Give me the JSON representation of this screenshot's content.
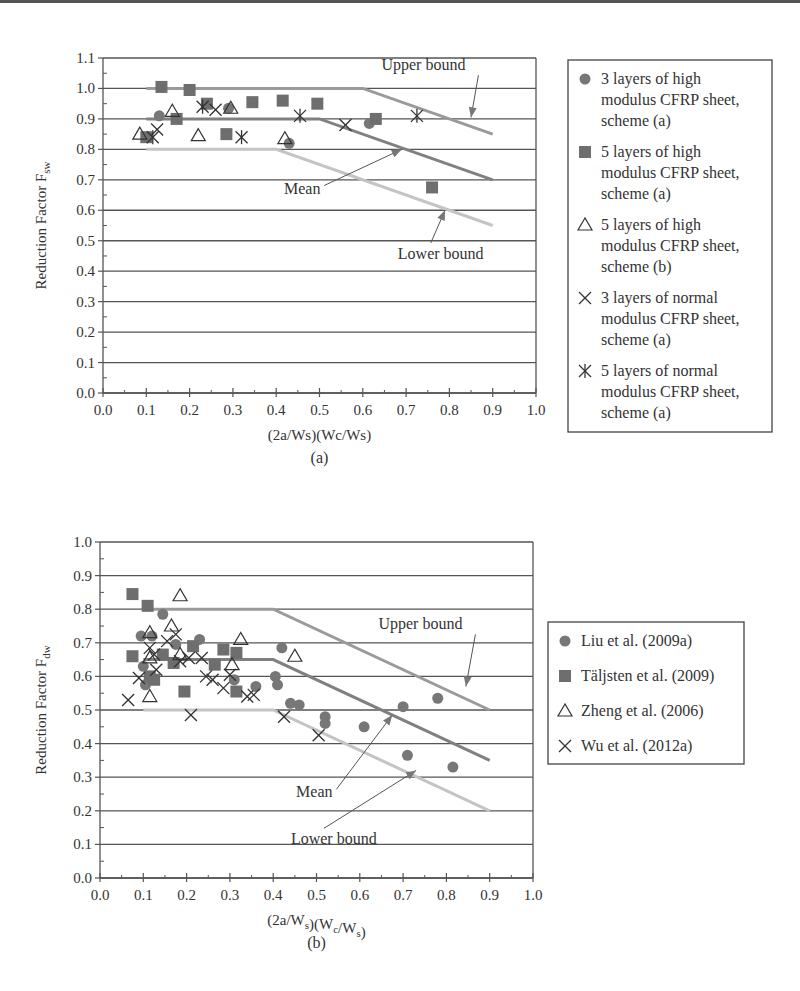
{
  "colors": {
    "grid": "#555555",
    "marker_fill": "#777777",
    "upper_line": "#9a9a9a",
    "mean_line": "#808080",
    "lower_line": "#c4c4c4",
    "text": "#333333"
  },
  "chart_data": [
    {
      "id": "a",
      "type": "scatter",
      "panel_label": "(a)",
      "title": "",
      "xlabel": "(2a/Ws)(Wc/Ws)",
      "ylabel": "Reduction Factor F",
      "ylabel_sub": "sw",
      "xlim": [
        0.0,
        1.0
      ],
      "ylim": [
        0.0,
        1.1
      ],
      "xticks": [
        "0.0",
        "0.1",
        "0.2",
        "0.3",
        "0.4",
        "0.5",
        "0.6",
        "0.7",
        "0.8",
        "0.9",
        "1.0"
      ],
      "yticks": [
        "0.0",
        "0.1",
        "0.2",
        "0.3",
        "0.4",
        "0.5",
        "0.6",
        "0.7",
        "0.8",
        "0.9",
        "1.0",
        "1.1"
      ],
      "grid": true,
      "legend_position": "right",
      "lines": [
        {
          "name": "Upper bound",
          "points": [
            [
              0.1,
              1.0
            ],
            [
              0.6,
              1.0
            ],
            [
              0.9,
              0.85
            ]
          ]
        },
        {
          "name": "Mean",
          "points": [
            [
              0.1,
              0.9
            ],
            [
              0.5,
              0.9
            ],
            [
              0.9,
              0.7
            ]
          ]
        },
        {
          "name": "Lower bound",
          "points": [
            [
              0.1,
              0.8
            ],
            [
              0.4,
              0.8
            ],
            [
              0.9,
              0.55
            ]
          ]
        }
      ],
      "annotations": [
        {
          "text": "Upper bound",
          "label_at": [
            0.74,
            1.06
          ],
          "arrow_to": [
            0.85,
            0.905
          ]
        },
        {
          "text": "Mean",
          "label_at": [
            0.46,
            0.655
          ],
          "arrow_to": [
            0.69,
            0.8
          ]
        },
        {
          "text": "Lower bound",
          "label_at": [
            0.78,
            0.44
          ],
          "arrow_to": [
            0.79,
            0.6
          ]
        }
      ],
      "series": [
        {
          "name": "3 layers of high modulus CFRP sheet, scheme (a)",
          "legend_lines": [
            "3 layers of high",
            "modulus CFRP sheet,",
            "scheme (a)"
          ],
          "marker": "circle",
          "points": [
            [
              0.13,
              0.91
            ],
            [
              0.29,
              0.935
            ],
            [
              0.43,
              0.82
            ],
            [
              0.615,
              0.885
            ]
          ]
        },
        {
          "name": "5 layers of high modulus CFRP sheet, scheme (a)",
          "legend_lines": [
            "5 layers of high",
            "modulus CFRP sheet,",
            "scheme (a)"
          ],
          "marker": "square",
          "points": [
            [
              0.1,
              0.84
            ],
            [
              0.135,
              1.005
            ],
            [
              0.17,
              0.9
            ],
            [
              0.2,
              0.995
            ],
            [
              0.24,
              0.95
            ],
            [
              0.285,
              0.85
            ],
            [
              0.345,
              0.955
            ],
            [
              0.415,
              0.96
            ],
            [
              0.495,
              0.95
            ],
            [
              0.63,
              0.9
            ],
            [
              0.76,
              0.675
            ]
          ]
        },
        {
          "name": "5 layers of high modulus CFRP sheet, scheme (b)",
          "legend_lines": [
            "5 layers of high",
            "modulus CFRP sheet,",
            "scheme (b)"
          ],
          "marker": "triangle",
          "points": [
            [
              0.085,
              0.85
            ],
            [
              0.16,
              0.925
            ],
            [
              0.22,
              0.845
            ],
            [
              0.295,
              0.935
            ],
            [
              0.42,
              0.835
            ]
          ]
        },
        {
          "name": "3 layers of normal modulus CFRP sheet, scheme (a)",
          "legend_lines": [
            "3 layers of normal",
            "modulus CFRP sheet,",
            "scheme (a)"
          ],
          "marker": "x",
          "points": [
            [
              0.125,
              0.865
            ],
            [
              0.26,
              0.93
            ],
            [
              0.56,
              0.88
            ]
          ]
        },
        {
          "name": "5 layers of normal modulus CFRP sheet, scheme (a)",
          "legend_lines": [
            "5 layers of normal",
            "modulus CFRP sheet,",
            "scheme (a)"
          ],
          "marker": "asterisk",
          "points": [
            [
              0.115,
              0.84
            ],
            [
              0.23,
              0.94
            ],
            [
              0.32,
              0.84
            ],
            [
              0.455,
              0.91
            ],
            [
              0.725,
              0.91
            ]
          ]
        }
      ]
    },
    {
      "id": "b",
      "type": "scatter",
      "panel_label": "(b)",
      "title": "",
      "xlabel": "(2a/W",
      "xlabel_parts": [
        [
          "(2a/W",
          ""
        ],
        [
          "s",
          "sub"
        ],
        [
          ")(W",
          ""
        ],
        [
          "c",
          "sub"
        ],
        [
          "/W",
          ""
        ],
        [
          "s",
          "sub"
        ],
        [
          ")",
          ""
        ]
      ],
      "ylabel": "Reduction Factor F",
      "ylabel_sub": "dw",
      "xlim": [
        0.0,
        1.0
      ],
      "ylim": [
        0.0,
        1.0
      ],
      "xticks": [
        "0.0",
        "0.1",
        "0.2",
        "0.3",
        "0.4",
        "0.5",
        "0.6",
        "0.7",
        "0.8",
        "0.9",
        "1.0"
      ],
      "yticks": [
        "0.0",
        "0.1",
        "0.2",
        "0.3",
        "0.4",
        "0.5",
        "0.6",
        "0.7",
        "0.8",
        "0.9",
        "1.0"
      ],
      "grid": true,
      "legend_position": "right",
      "lines": [
        {
          "name": "Upper bound",
          "points": [
            [
              0.1,
              0.8
            ],
            [
              0.4,
              0.8
            ],
            [
              0.9,
              0.5
            ]
          ]
        },
        {
          "name": "Mean",
          "points": [
            [
              0.1,
              0.65
            ],
            [
              0.4,
              0.65
            ],
            [
              0.9,
              0.35
            ]
          ]
        },
        {
          "name": "Lower bound",
          "points": [
            [
              0.1,
              0.5
            ],
            [
              0.4,
              0.5
            ],
            [
              0.9,
              0.2
            ]
          ]
        }
      ],
      "annotations": [
        {
          "text": "Upper bound",
          "label_at": [
            0.74,
            0.74
          ],
          "arrow_to": [
            0.845,
            0.57
          ]
        },
        {
          "text": "Mean",
          "label_at": [
            0.495,
            0.24
          ],
          "arrow_to": [
            0.675,
            0.485
          ]
        },
        {
          "text": "Lower bound",
          "label_at": [
            0.54,
            0.1
          ],
          "arrow_to": [
            0.73,
            0.32
          ]
        }
      ],
      "series": [
        {
          "name": "Liu et al. (2009a)",
          "marker": "circle",
          "points": [
            [
              0.095,
              0.72
            ],
            [
              0.1,
              0.63
            ],
            [
              0.105,
              0.575
            ],
            [
              0.12,
              0.72
            ],
            [
              0.145,
              0.785
            ],
            [
              0.175,
              0.695
            ],
            [
              0.17,
              0.64
            ],
            [
              0.23,
              0.71
            ],
            [
              0.31,
              0.59
            ],
            [
              0.36,
              0.57
            ],
            [
              0.42,
              0.685
            ],
            [
              0.405,
              0.6
            ],
            [
              0.41,
              0.575
            ],
            [
              0.44,
              0.52
            ],
            [
              0.46,
              0.515
            ],
            [
              0.52,
              0.48
            ],
            [
              0.52,
              0.46
            ],
            [
              0.61,
              0.45
            ],
            [
              0.7,
              0.51
            ],
            [
              0.71,
              0.365
            ],
            [
              0.78,
              0.535
            ],
            [
              0.815,
              0.33
            ]
          ]
        },
        {
          "name": "Täljsten et al. (2009)",
          "marker": "square",
          "points": [
            [
              0.075,
              0.845
            ],
            [
              0.075,
              0.66
            ],
            [
              0.11,
              0.81
            ],
            [
              0.115,
              0.6
            ],
            [
              0.125,
              0.59
            ],
            [
              0.145,
              0.665
            ],
            [
              0.17,
              0.64
            ],
            [
              0.195,
              0.555
            ],
            [
              0.215,
              0.69
            ],
            [
              0.265,
              0.635
            ],
            [
              0.285,
              0.68
            ],
            [
              0.315,
              0.67
            ],
            [
              0.315,
              0.555
            ]
          ]
        },
        {
          "name": "Zheng et al. (2006)",
          "marker": "triangle",
          "points": [
            [
              0.185,
              0.84
            ],
            [
              0.115,
              0.73
            ],
            [
              0.165,
              0.75
            ],
            [
              0.115,
              0.655
            ],
            [
              0.185,
              0.665
            ],
            [
              0.115,
              0.54
            ],
            [
              0.325,
              0.71
            ],
            [
              0.305,
              0.635
            ],
            [
              0.45,
              0.66
            ]
          ]
        },
        {
          "name": "Wu et al. (2012a)",
          "marker": "x",
          "points": [
            [
              0.065,
              0.53
            ],
            [
              0.09,
              0.595
            ],
            [
              0.115,
              0.685
            ],
            [
              0.125,
              0.665
            ],
            [
              0.13,
              0.62
            ],
            [
              0.155,
              0.705
            ],
            [
              0.175,
              0.725
            ],
            [
              0.185,
              0.645
            ],
            [
              0.205,
              0.655
            ],
            [
              0.21,
              0.485
            ],
            [
              0.235,
              0.655
            ],
            [
              0.245,
              0.6
            ],
            [
              0.26,
              0.59
            ],
            [
              0.285,
              0.565
            ],
            [
              0.3,
              0.605
            ],
            [
              0.34,
              0.54
            ],
            [
              0.355,
              0.545
            ],
            [
              0.425,
              0.48
            ],
            [
              0.505,
              0.425
            ]
          ]
        }
      ]
    }
  ]
}
